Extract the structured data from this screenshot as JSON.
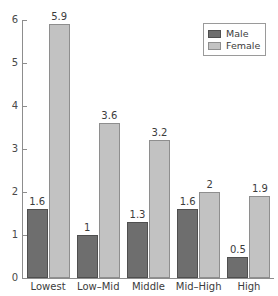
{
  "chart_data": {
    "type": "bar",
    "title": "",
    "subtitle": "",
    "xlabel": "",
    "ylabel": "",
    "categories": [
      "Lowest",
      "Low–Mid",
      "Middle",
      "Mid–High",
      "High"
    ],
    "series": [
      {
        "name": "Male",
        "values": [
          1.6,
          1,
          1.3,
          1.6,
          0.5
        ],
        "labels": [
          "1.6",
          "1",
          "1.3",
          "1.6",
          "0.5"
        ],
        "color": "#6e6e6e"
      },
      {
        "name": "Female",
        "values": [
          5.9,
          3.6,
          3.2,
          2,
          1.9
        ],
        "labels": [
          "5.9",
          "3.6",
          "3.2",
          "2",
          "1.9"
        ],
        "color": "#c2c2c2"
      }
    ],
    "ylim": [
      0,
      6
    ],
    "yticks": [
      0,
      1,
      2,
      3,
      4,
      5,
      6
    ],
    "ytick_labels": [
      "0",
      "1",
      "2",
      "3",
      "4",
      "5",
      "6"
    ],
    "grid": false,
    "legend_position": "top-right",
    "legend_entries": [
      "Male",
      "Female"
    ]
  },
  "legend": {
    "male_label": "Male",
    "female_label": "Female"
  },
  "axis": {
    "y_labels": [
      "6",
      "5",
      "4",
      "3",
      "2",
      "1",
      "0"
    ]
  }
}
